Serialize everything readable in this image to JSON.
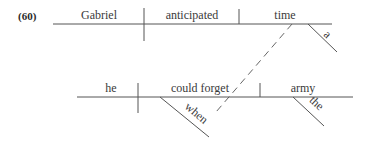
{
  "example_number": "(60)",
  "main_clause": {
    "subject": "Gabriel",
    "verb": "anticipated",
    "object": "time",
    "object_modifier": "a"
  },
  "subordinate_clause": {
    "subject": "he",
    "verb": "could forget",
    "verb_modifier": "when",
    "object": "army",
    "object_modifier": "the"
  },
  "colors": {
    "line": "#555555",
    "text": "#3a3a3a"
  }
}
